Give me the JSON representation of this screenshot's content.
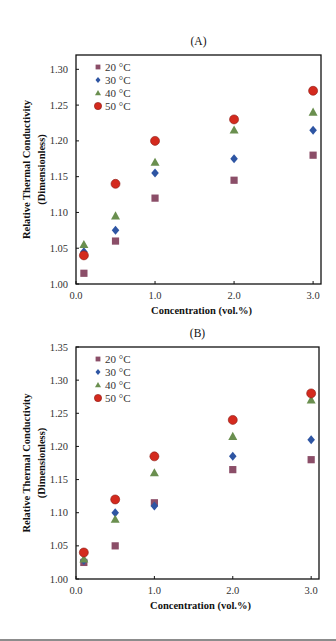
{
  "figure": {
    "panels": [
      "(A)",
      "(B)"
    ]
  },
  "chart_data": [
    {
      "type": "scatter",
      "title": "(A)",
      "xlabel": "Concentration (vol.%)",
      "ylabel": "Relative Thermal Conductivity (Dimensionless)",
      "xlim": [
        0.0,
        3.1
      ],
      "ylim": [
        1.0,
        1.32
      ],
      "xticks": [
        0.0,
        1.0,
        2.0,
        3.0
      ],
      "xtick_labels": [
        "0.0",
        "1.0",
        "2.0",
        "3.0"
      ],
      "yticks": [
        1.0,
        1.05,
        1.1,
        1.15,
        1.2,
        1.25,
        1.3
      ],
      "ytick_labels": [
        "1.00",
        "1.05",
        "1.10",
        "1.15",
        "1.20",
        "1.25",
        "1.30"
      ],
      "grid": false,
      "legend_position": "upper left",
      "x": [
        0.1,
        0.5,
        1.0,
        2.0,
        3.0
      ],
      "series": [
        {
          "name": "20 °C",
          "marker": "square",
          "color": "#8B4E68",
          "values": [
            1.015,
            1.06,
            1.12,
            1.145,
            1.18
          ]
        },
        {
          "name": "30 °C",
          "marker": "diamond",
          "color": "#2E55A3",
          "values": [
            1.045,
            1.075,
            1.155,
            1.175,
            1.215
          ]
        },
        {
          "name": "40 °C",
          "marker": "triangle",
          "color": "#6A8F4F",
          "values": [
            1.055,
            1.095,
            1.17,
            1.215,
            1.24
          ]
        },
        {
          "name": "50 °C",
          "marker": "circle",
          "color": "#D42A1E",
          "values": [
            1.04,
            1.14,
            1.2,
            1.23,
            1.27
          ]
        }
      ]
    },
    {
      "type": "scatter",
      "title": "(B)",
      "xlabel": "Concentration (vol.%)",
      "ylabel": "Relative Thermal Conductivity (Dimensionless)",
      "xlim": [
        0.0,
        3.1
      ],
      "ylim": [
        1.0,
        1.35
      ],
      "xticks": [
        0.0,
        1.0,
        2.0,
        3.0
      ],
      "xtick_labels": [
        "0.0",
        "1.0",
        "2.0",
        "3.0"
      ],
      "yticks": [
        1.0,
        1.05,
        1.1,
        1.15,
        1.2,
        1.25,
        1.3,
        1.35
      ],
      "ytick_labels": [
        "1.00",
        "1.05",
        "1.10",
        "1.15",
        "1.20",
        "1.25",
        "1.30",
        "1.35"
      ],
      "grid": false,
      "legend_position": "upper left",
      "x": [
        0.1,
        0.5,
        1.0,
        2.0,
        3.0
      ],
      "series": [
        {
          "name": "20 °C",
          "marker": "square",
          "color": "#8B4E68",
          "values": [
            1.025,
            1.05,
            1.115,
            1.165,
            1.18
          ]
        },
        {
          "name": "30 °C",
          "marker": "diamond",
          "color": "#2E55A3",
          "values": [
            1.028,
            1.1,
            1.11,
            1.185,
            1.21
          ]
        },
        {
          "name": "40 °C",
          "marker": "triangle",
          "color": "#6A8F4F",
          "values": [
            1.03,
            1.09,
            1.16,
            1.215,
            1.27
          ]
        },
        {
          "name": "50 °C",
          "marker": "circle",
          "color": "#D42A1E",
          "values": [
            1.04,
            1.12,
            1.185,
            1.24,
            1.28
          ]
        }
      ]
    }
  ]
}
